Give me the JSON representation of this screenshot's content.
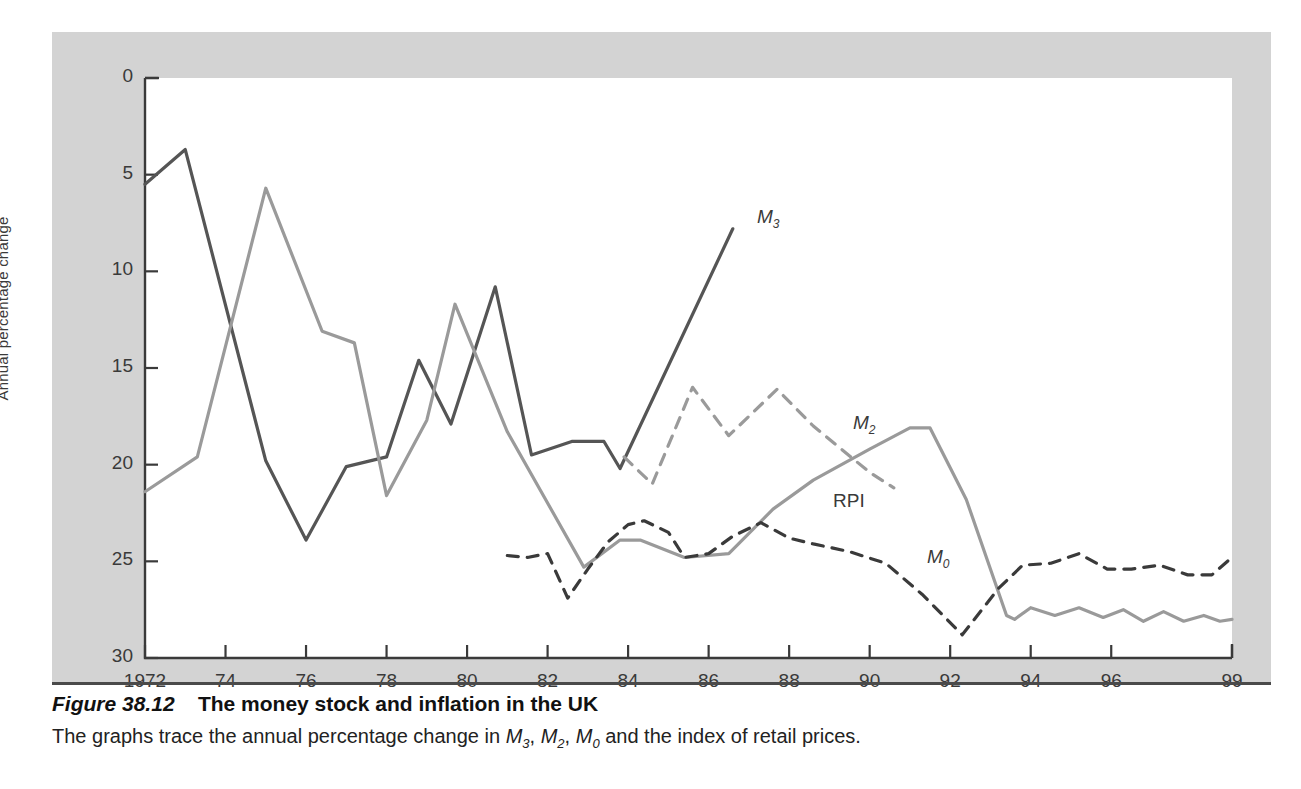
{
  "figure": {
    "number": "Figure 38.12",
    "title": "The money stock and inflation in the UK",
    "subtitle_parts": {
      "a": "The graphs trace the annual percentage change in ",
      "m3": "M",
      "m3sub": "3",
      "sep1": ", ",
      "m2": "M",
      "m2sub": "2",
      "sep2": ", ",
      "m0": "M",
      "m0sub": "0",
      "b": " and the index of retail prices."
    }
  },
  "axes": {
    "ylabel": "Annual percentage change",
    "yticks": [
      "30",
      "25",
      "20",
      "15",
      "10",
      "5",
      "0"
    ],
    "xticks": [
      "1972",
      "74",
      "76",
      "78",
      "80",
      "82",
      "84",
      "86",
      "88",
      "90",
      "92",
      "94",
      "96",
      "99"
    ]
  },
  "series_labels": {
    "m3": {
      "base": "M",
      "sub": "3"
    },
    "m2": {
      "base": "M",
      "sub": "2"
    },
    "m0": {
      "base": "M",
      "sub": "0"
    },
    "rpi": {
      "base": "RPI",
      "sub": ""
    }
  },
  "colors": {
    "panel": "#d3d3d3",
    "plot_bg": "#ffffff",
    "dark_line": "#555555",
    "grey_line": "#9a9a9a",
    "axis": "#3a3a3a",
    "text": "#3a3a3a"
  },
  "chart_data": {
    "type": "line",
    "title": "The money stock and inflation in the UK",
    "xlabel": "",
    "ylabel": "Annual percentage change",
    "xlim": [
      1972,
      1999
    ],
    "ylim": [
      0,
      30
    ],
    "yticks": [
      0,
      5,
      10,
      15,
      20,
      25,
      30
    ],
    "xticks": [
      1972,
      1974,
      1976,
      1978,
      1980,
      1982,
      1984,
      1986,
      1988,
      1990,
      1992,
      1994,
      1996,
      1999
    ],
    "grid": false,
    "legend": "inline-annotations",
    "series": [
      {
        "name": "M3",
        "style": "solid",
        "color": "#555555",
        "x": [
          1972.0,
          1973.0,
          1975.0,
          1976.0,
          1977.0,
          1978.0,
          1978.8,
          1979.6,
          1980.7,
          1981.6,
          1982.6,
          1983.4,
          1983.8,
          1986.6
        ],
        "values": [
          24.5,
          26.3,
          10.2,
          6.1,
          9.9,
          10.4,
          15.4,
          12.1,
          19.2,
          10.5,
          11.2,
          11.2,
          9.8,
          22.2
        ]
      },
      {
        "name": "RPI",
        "style": "solid",
        "color": "#9a9a9a",
        "x": [
          1972.0,
          1973.3,
          1975.0,
          1976.4,
          1977.2,
          1978.0,
          1979.0,
          1979.7,
          1981.0,
          1982.9,
          1983.8,
          1984.3,
          1985.4,
          1986.5,
          1987.6,
          1988.6,
          1990.0,
          1991.0,
          1991.5,
          1992.4,
          1993.4,
          1993.6,
          1994.0,
          1994.6,
          1995.2,
          1995.8,
          1996.3,
          1996.8,
          1997.3,
          1997.8,
          1998.3,
          1998.7,
          1999.0
        ],
        "values": [
          8.6,
          10.4,
          24.3,
          16.9,
          16.3,
          8.4,
          12.3,
          18.3,
          11.7,
          4.7,
          6.1,
          6.1,
          5.2,
          5.4,
          7.7,
          9.2,
          10.8,
          11.9,
          11.9,
          8.2,
          2.2,
          2.0,
          2.6,
          2.2,
          2.6,
          2.1,
          2.5,
          1.9,
          2.4,
          1.9,
          2.2,
          1.9,
          2.0
        ]
      },
      {
        "name": "M2",
        "style": "dashed",
        "color": "#9a9a9a",
        "x": [
          1983.9,
          1984.6,
          1985.6,
          1986.5,
          1987.7,
          1988.6,
          1990.0,
          1990.6
        ],
        "values": [
          10.4,
          9.0,
          14.0,
          11.5,
          13.9,
          12.0,
          9.6,
          8.8
        ]
      },
      {
        "name": "M0",
        "style": "dashed",
        "color": "#3a3a3a",
        "x": [
          1981.0,
          1981.5,
          1982.0,
          1982.5,
          1983.0,
          1983.5,
          1984.0,
          1984.4,
          1985.0,
          1985.4,
          1986.0,
          1986.6,
          1987.3,
          1988.0,
          1988.6,
          1989.5,
          1990.4,
          1991.3,
          1992.3,
          1993.2,
          1993.8,
          1994.5,
          1995.2,
          1995.9,
          1996.5,
          1997.2,
          1997.9,
          1998.5,
          1999.0
        ],
        "values": [
          5.3,
          5.2,
          5.4,
          3.1,
          4.6,
          6.0,
          6.9,
          7.1,
          6.5,
          5.2,
          5.4,
          6.3,
          7.0,
          6.2,
          5.9,
          5.5,
          4.9,
          3.3,
          1.2,
          3.6,
          4.8,
          4.9,
          5.4,
          4.6,
          4.6,
          4.8,
          4.3,
          4.3,
          5.2
        ]
      }
    ]
  }
}
